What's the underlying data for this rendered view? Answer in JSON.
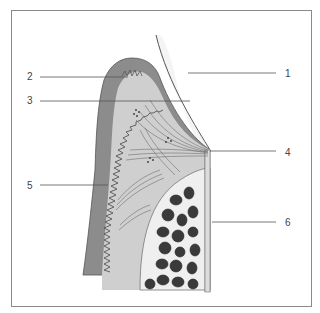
{
  "diagram": {
    "type": "anatomical cross-section (gingiva and tooth)",
    "labels": [
      {
        "id": "1",
        "text": "1",
        "x": 285,
        "y": 69,
        "side": "right",
        "leader": {
          "x1": 188,
          "y1": 73,
          "x2": 276,
          "y2": 73
        }
      },
      {
        "id": "2",
        "text": "2",
        "x": 27,
        "y": 72,
        "side": "left",
        "leader": {
          "x1": 40,
          "y1": 77,
          "x2": 128,
          "y2": 77
        }
      },
      {
        "id": "3",
        "text": "3",
        "x": 27,
        "y": 96,
        "side": "left",
        "leader": {
          "x1": 40,
          "y1": 101,
          "x2": 190,
          "y2": 101
        }
      },
      {
        "id": "4",
        "text": "4",
        "x": 285,
        "y": 148,
        "side": "right",
        "leader": {
          "x1": 210,
          "y1": 151,
          "x2": 276,
          "y2": 151
        }
      },
      {
        "id": "5",
        "text": "5",
        "x": 27,
        "y": 181,
        "side": "left",
        "leader": {
          "x1": 40,
          "y1": 185,
          "x2": 108,
          "y2": 185
        }
      },
      {
        "id": "6",
        "text": "6",
        "x": 285,
        "y": 221,
        "side": "right",
        "leader": {
          "x1": 212,
          "y1": 222,
          "x2": 276,
          "y2": 222
        }
      }
    ],
    "colors": {
      "frame": "#8a8a8a",
      "epithelium": "#8c8c8c",
      "connective_tissue": "#cfcfcf",
      "enamel_space": "#f4f4f4",
      "bone_lining": "#efefef",
      "bone_cells": "#3a3a3a",
      "fibers": "#6e6e6e",
      "leader": "#555555",
      "label_text": "#444444"
    }
  }
}
